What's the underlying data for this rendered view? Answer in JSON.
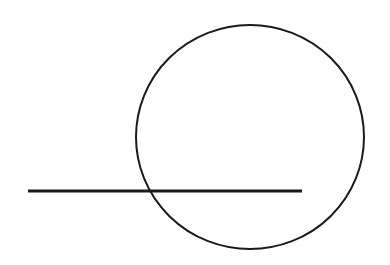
{
  "diagram": {
    "background": "#ffffff",
    "stroke_color": "#1a1a1a",
    "circle": {
      "cx": 250,
      "cy": 137,
      "rx": 114,
      "ry": 112,
      "stroke_width": 2
    },
    "line": {
      "x1": 28,
      "y1": 191,
      "x2": 302,
      "y2": 191,
      "stroke_width": 3
    }
  }
}
